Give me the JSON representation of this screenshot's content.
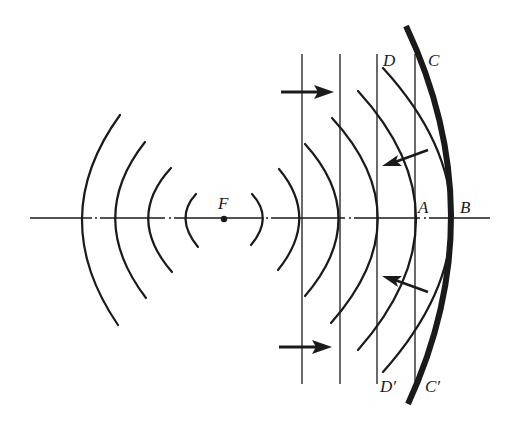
{
  "diagram": {
    "colors": {
      "background": "#ffffff",
      "ink": "#1a1a1a"
    },
    "labels": {
      "focus": "F",
      "A": "A",
      "B": "B",
      "C": "C",
      "D": "D",
      "C_prime": "C′",
      "D_prime": "D′"
    },
    "elements": {
      "axis": "optical axis (dash-dot line)",
      "mirror": "parabolic mirror (thick curve)",
      "wavefronts_left": 4,
      "wavefronts_right_curved": 5,
      "plane_wavefronts": 4,
      "arrows_incoming": 2,
      "arrows_reflected": 2
    }
  }
}
